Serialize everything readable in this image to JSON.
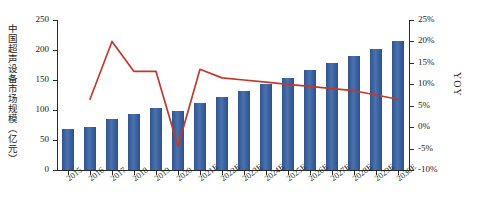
{
  "chart_data": {
    "type": "bar",
    "title": "",
    "xlabel": "",
    "ylabel": "中国超声设备市场规模（亿元）",
    "y2label": "YOY",
    "ylim": [
      0,
      250
    ],
    "y2lim": [
      -10,
      25
    ],
    "grid": false,
    "legend": "none",
    "categories": [
      "2015",
      "2016",
      "2017",
      "2018",
      "2019",
      "2020",
      "2021E",
      "2022E",
      "2023E",
      "2024E",
      "2025E",
      "2026E",
      "2027E",
      "2028E",
      "2029E",
      "2030E"
    ],
    "series": [
      {
        "name": "中国超声设备市场规模（亿元）",
        "type": "bar",
        "axis": "left",
        "color": "#3a5f9e",
        "values": [
          68,
          71,
          85,
          93,
          104,
          98,
          111,
          122,
          132,
          143,
          154,
          166,
          178,
          190,
          202,
          215
        ]
      },
      {
        "name": "YOY",
        "type": "line",
        "axis": "right",
        "color": "#c0392b",
        "values": [
          null,
          6.5,
          20.0,
          13.0,
          13.0,
          -4.5,
          13.5,
          11.5,
          11.0,
          10.5,
          10.0,
          9.5,
          9.0,
          8.5,
          7.5,
          6.5
        ]
      }
    ],
    "yticks": [
      0,
      50,
      100,
      150,
      200,
      250
    ],
    "ytick_labels": [
      "0",
      "50",
      "100",
      "150",
      "200",
      "250"
    ],
    "y2ticks": [
      -10,
      -5,
      0,
      5,
      10,
      15,
      20,
      25
    ],
    "y2tick_labels": [
      "-10%",
      "-5%",
      "0%",
      "5%",
      "10%",
      "15%",
      "20%",
      "25%"
    ]
  }
}
